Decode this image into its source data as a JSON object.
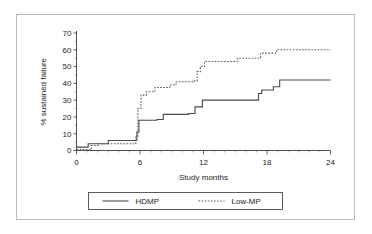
{
  "chart_data": {
    "type": "line",
    "title": "",
    "xlabel": "Study months",
    "ylabel": "% sustained failure",
    "xlim": [
      0,
      24
    ],
    "ylim": [
      0,
      70
    ],
    "xticks": [
      0,
      6,
      12,
      18,
      24
    ],
    "xtick_labels": [
      "0",
      "6",
      "12",
      "18",
      "24"
    ],
    "x_minor_tick_interval": 1,
    "yticks": [
      0,
      10,
      20,
      30,
      40,
      50,
      60,
      70
    ],
    "ytick_labels": [
      "0",
      "10",
      "20",
      "30",
      "40",
      "50",
      "60",
      "70"
    ],
    "grid": false,
    "legend_position": "below-plot",
    "series": [
      {
        "name": "HDMP",
        "style": "solid",
        "color": "#4a4a4a",
        "step": "post",
        "points": [
          [
            0.0,
            2.0
          ],
          [
            1.1,
            2.0
          ],
          [
            1.1,
            4.0
          ],
          [
            3.0,
            4.0
          ],
          [
            3.0,
            6.0
          ],
          [
            5.7,
            6.0
          ],
          [
            5.7,
            11.0
          ],
          [
            5.9,
            11.0
          ],
          [
            5.9,
            18.0
          ],
          [
            7.6,
            18.0
          ],
          [
            7.6,
            18.5
          ],
          [
            8.2,
            18.5
          ],
          [
            8.2,
            21.5
          ],
          [
            10.6,
            21.5
          ],
          [
            10.6,
            22.0
          ],
          [
            11.2,
            22.0
          ],
          [
            11.2,
            26.0
          ],
          [
            11.9,
            26.0
          ],
          [
            11.9,
            30.0
          ],
          [
            17.2,
            30.0
          ],
          [
            17.2,
            34.0
          ],
          [
            17.5,
            34.0
          ],
          [
            17.5,
            36.0
          ],
          [
            18.6,
            36.0
          ],
          [
            18.6,
            38.0
          ],
          [
            19.2,
            38.0
          ],
          [
            19.2,
            42.0
          ],
          [
            24.0,
            42.0
          ]
        ]
      },
      {
        "name": "Low-MP",
        "style": "dotted",
        "color": "#5a5a5a",
        "step": "post",
        "points": [
          [
            0.0,
            0.5
          ],
          [
            1.4,
            0.5
          ],
          [
            1.4,
            3.0
          ],
          [
            2.1,
            3.0
          ],
          [
            2.1,
            4.0
          ],
          [
            5.6,
            4.0
          ],
          [
            5.6,
            8.0
          ],
          [
            5.8,
            8.0
          ],
          [
            5.8,
            25.0
          ],
          [
            6.1,
            25.0
          ],
          [
            6.1,
            33.0
          ],
          [
            6.6,
            33.0
          ],
          [
            6.6,
            35.0
          ],
          [
            7.4,
            35.0
          ],
          [
            7.4,
            37.5
          ],
          [
            8.8,
            37.5
          ],
          [
            8.8,
            39.0
          ],
          [
            9.4,
            39.0
          ],
          [
            9.4,
            41.0
          ],
          [
            11.0,
            41.0
          ],
          [
            11.0,
            41.5
          ],
          [
            11.4,
            41.5
          ],
          [
            11.4,
            47.0
          ],
          [
            11.7,
            47.0
          ],
          [
            11.7,
            50.0
          ],
          [
            12.1,
            50.0
          ],
          [
            12.1,
            53.0
          ],
          [
            15.2,
            53.0
          ],
          [
            15.2,
            55.0
          ],
          [
            17.4,
            55.0
          ],
          [
            17.4,
            58.0
          ],
          [
            18.9,
            58.0
          ],
          [
            18.9,
            60.0
          ],
          [
            24.0,
            60.0
          ]
        ]
      }
    ],
    "legend": [
      {
        "label": "HDMP",
        "style": "solid"
      },
      {
        "label": "Low-MP",
        "style": "dotted"
      }
    ]
  }
}
